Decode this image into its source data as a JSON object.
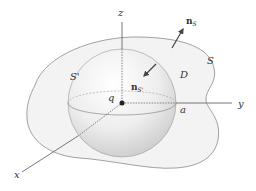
{
  "figure": {
    "type": "3D vector-field diagram: closed surface S enclosing a spherical surface S' around point charge q",
    "labels": {
      "z_axis": "z",
      "y_axis": "y",
      "x_axis": "x",
      "outer_surface": "S",
      "inner_surface": "S'",
      "region": "D",
      "charge": "q",
      "radius": "a",
      "normal_outer": {
        "base": "n",
        "subscript": "S"
      },
      "normal_inner": {
        "base": "n",
        "subscript": "S'"
      }
    },
    "colors": {
      "outer_fill": "#f3f3f3",
      "outline": "#8a8a8a",
      "sphere_highlight": "#ffffff",
      "sphere_shadow": "#cfcfcf",
      "axis": "#555555",
      "text": "#333333"
    }
  }
}
